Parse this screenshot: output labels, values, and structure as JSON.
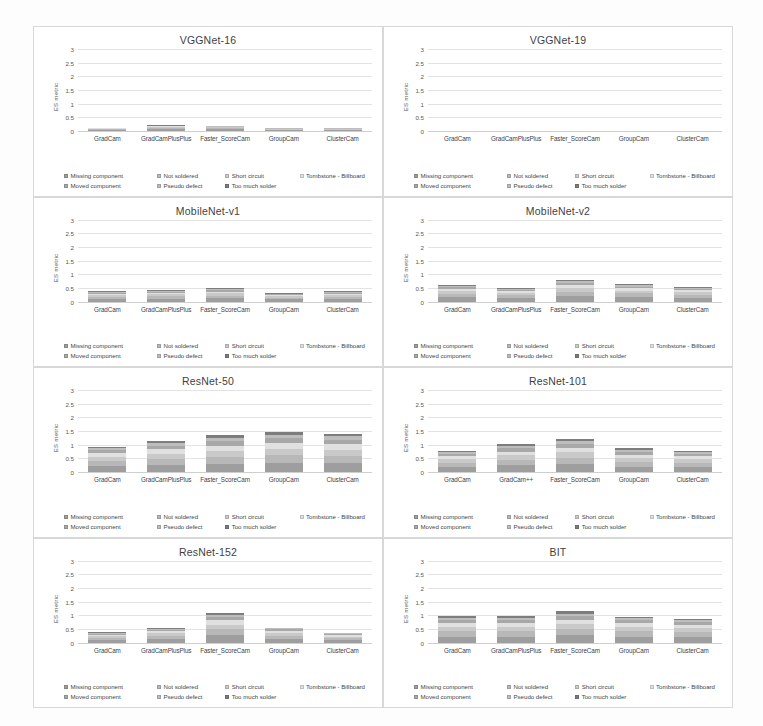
{
  "figure": {
    "ylabel": "ES metric",
    "yticks": [
      "0",
      "0.5",
      "1",
      "1.5",
      "2",
      "2.5",
      "3"
    ],
    "ylim": [
      0,
      3
    ]
  },
  "legend": [
    {
      "label": "Missing component",
      "color": "#9e9e9e"
    },
    {
      "label": "Not soldered",
      "color": "#b8b8b8"
    },
    {
      "label": "Short circuit",
      "color": "#c9c9c9"
    },
    {
      "label": "Tombstone - Billboard",
      "color": "#e0e0e0"
    },
    {
      "label": "Moved component",
      "color": "#a8a8a8"
    },
    {
      "label": "Pseudo defect",
      "color": "#bdbdbd"
    },
    {
      "label": "Too much solder",
      "color": "#7d7d7d"
    }
  ],
  "chart_data": [
    {
      "type": "bar",
      "title": "VGGNet-16",
      "xlabel": "",
      "ylabel": "ES metric",
      "ylim": [
        0,
        3
      ],
      "grid": true,
      "legend_position": "bottom",
      "categories": [
        "GradCam",
        "GradCamPlusPlus",
        "Faster_ScoreCam",
        "GroupCam",
        "ClusterCam"
      ],
      "series": [
        {
          "name": "Missing component",
          "values": [
            0.04,
            0.07,
            0.06,
            0.03,
            0.03
          ]
        },
        {
          "name": "Not soldered",
          "values": [
            0.03,
            0.05,
            0.04,
            0.02,
            0.02
          ]
        },
        {
          "name": "Short circuit",
          "values": [
            0.02,
            0.03,
            0.03,
            0.02,
            0.02
          ]
        },
        {
          "name": "Tombstone - Billboard",
          "values": [
            0.01,
            0.02,
            0.02,
            0.01,
            0.01
          ]
        },
        {
          "name": "Moved component",
          "values": [
            0.01,
            0.02,
            0.01,
            0.01,
            0.01
          ]
        },
        {
          "name": "Pseudo defect",
          "values": [
            0.01,
            0.01,
            0.01,
            0.01,
            0.01
          ]
        },
        {
          "name": "Too much solder",
          "values": [
            0.01,
            0.01,
            0.01,
            0.01,
            0.01
          ]
        }
      ],
      "totals": [
        0.13,
        0.21,
        0.18,
        0.11,
        0.11
      ]
    },
    {
      "type": "bar",
      "title": "VGGNet-19",
      "xlabel": "",
      "ylabel": "ES metric",
      "ylim": [
        0,
        3
      ],
      "grid": true,
      "legend_position": "bottom",
      "categories": [
        "GradCam",
        "GradCamPlusPlus",
        "Faster_ScoreCam",
        "GroupCam",
        "ClusterCam"
      ],
      "series": [
        {
          "name": "Missing component",
          "values": [
            0,
            0,
            0,
            0,
            0
          ]
        },
        {
          "name": "Not soldered",
          "values": [
            0,
            0,
            0,
            0,
            0
          ]
        },
        {
          "name": "Short circuit",
          "values": [
            0,
            0,
            0,
            0,
            0
          ]
        },
        {
          "name": "Tombstone - Billboard",
          "values": [
            0,
            0,
            0,
            0,
            0
          ]
        },
        {
          "name": "Moved component",
          "values": [
            0,
            0,
            0,
            0,
            0
          ]
        },
        {
          "name": "Pseudo defect",
          "values": [
            0,
            0,
            0,
            0,
            0
          ]
        },
        {
          "name": "Too much solder",
          "values": [
            0,
            0,
            0,
            0,
            0
          ]
        }
      ],
      "totals": [
        0,
        0,
        0,
        0,
        0
      ]
    },
    {
      "type": "bar",
      "title": "MobileNet-v1",
      "xlabel": "",
      "ylabel": "ES metric",
      "ylim": [
        0,
        3
      ],
      "grid": true,
      "legend_position": "bottom",
      "categories": [
        "GradCam",
        "GradCamPlusPlus",
        "Faster_ScoreCam",
        "GroupCam",
        "ClusterCam"
      ],
      "series": [
        {
          "name": "Missing component",
          "values": [
            0.1,
            0.11,
            0.12,
            0.08,
            0.1
          ]
        },
        {
          "name": "Not soldered",
          "values": [
            0.08,
            0.09,
            0.1,
            0.06,
            0.08
          ]
        },
        {
          "name": "Short circuit",
          "values": [
            0.06,
            0.07,
            0.08,
            0.05,
            0.06
          ]
        },
        {
          "name": "Tombstone - Billboard",
          "values": [
            0.05,
            0.05,
            0.06,
            0.04,
            0.05
          ]
        },
        {
          "name": "Moved component",
          "values": [
            0.04,
            0.04,
            0.05,
            0.03,
            0.04
          ]
        },
        {
          "name": "Pseudo defect",
          "values": [
            0.03,
            0.03,
            0.04,
            0.02,
            0.03
          ]
        },
        {
          "name": "Too much solder",
          "values": [
            0.02,
            0.03,
            0.03,
            0.02,
            0.02
          ]
        }
      ],
      "totals": [
        0.38,
        0.42,
        0.48,
        0.3,
        0.38
      ]
    },
    {
      "type": "bar",
      "title": "MobileNet-v2",
      "xlabel": "",
      "ylabel": "ES metric",
      "ylim": [
        0,
        3
      ],
      "grid": true,
      "legend_position": "bottom",
      "categories": [
        "GradCam",
        "GradCamPlusPlus",
        "Faster_ScoreCam",
        "GroupCam",
        "ClusterCam"
      ],
      "series": [
        {
          "name": "Missing component",
          "values": [
            0.16,
            0.13,
            0.2,
            0.17,
            0.14
          ]
        },
        {
          "name": "Not soldered",
          "values": [
            0.12,
            0.1,
            0.16,
            0.13,
            0.11
          ]
        },
        {
          "name": "Short circuit",
          "values": [
            0.1,
            0.08,
            0.13,
            0.1,
            0.09
          ]
        },
        {
          "name": "Tombstone - Billboard",
          "values": [
            0.08,
            0.06,
            0.1,
            0.08,
            0.07
          ]
        },
        {
          "name": "Moved component",
          "values": [
            0.06,
            0.05,
            0.08,
            0.06,
            0.05
          ]
        },
        {
          "name": "Pseudo defect",
          "values": [
            0.05,
            0.04,
            0.07,
            0.05,
            0.04
          ]
        },
        {
          "name": "Too much solder",
          "values": [
            0.03,
            0.04,
            0.06,
            0.06,
            0.05
          ]
        }
      ],
      "totals": [
        0.6,
        0.5,
        0.8,
        0.65,
        0.55
      ]
    },
    {
      "type": "bar",
      "title": "ResNet-50",
      "xlabel": "",
      "ylabel": "ES metric",
      "ylim": [
        0,
        3
      ],
      "grid": true,
      "legend_position": "bottom",
      "categories": [
        "GradCam",
        "GradCamPlusPlus",
        "Faster_ScoreCam",
        "GroupCam",
        "ClusterCam"
      ],
      "series": [
        {
          "name": "Missing component",
          "values": [
            0.22,
            0.26,
            0.3,
            0.33,
            0.32
          ]
        },
        {
          "name": "Not soldered",
          "values": [
            0.18,
            0.22,
            0.26,
            0.28,
            0.27
          ]
        },
        {
          "name": "Short circuit",
          "values": [
            0.15,
            0.19,
            0.22,
            0.24,
            0.23
          ]
        },
        {
          "name": "Tombstone - Billboard",
          "values": [
            0.13,
            0.16,
            0.19,
            0.21,
            0.2
          ]
        },
        {
          "name": "Moved component",
          "values": [
            0.11,
            0.14,
            0.16,
            0.17,
            0.17
          ]
        },
        {
          "name": "Pseudo defect",
          "values": [
            0.08,
            0.1,
            0.12,
            0.13,
            0.12
          ]
        },
        {
          "name": "Too much solder",
          "values": [
            0.06,
            0.08,
            0.1,
            0.09,
            0.09
          ]
        }
      ],
      "totals": [
        0.93,
        1.15,
        1.35,
        1.45,
        1.4
      ]
    },
    {
      "type": "bar",
      "title": "ResNet-101",
      "xlabel": "",
      "ylabel": "ES metric",
      "ylim": [
        0,
        3
      ],
      "grid": true,
      "legend_position": "bottom",
      "categories": [
        "GradCam",
        "GradCam++",
        "Faster_ScoreCam",
        "GroupCam",
        "ClusterCam"
      ],
      "series": [
        {
          "name": "Missing component",
          "values": [
            0.18,
            0.24,
            0.28,
            0.2,
            0.18
          ]
        },
        {
          "name": "Not soldered",
          "values": [
            0.15,
            0.2,
            0.24,
            0.17,
            0.15
          ]
        },
        {
          "name": "Short circuit",
          "values": [
            0.13,
            0.17,
            0.2,
            0.14,
            0.13
          ]
        },
        {
          "name": "Tombstone - Billboard",
          "values": [
            0.11,
            0.14,
            0.17,
            0.12,
            0.11
          ]
        },
        {
          "name": "Moved component",
          "values": [
            0.09,
            0.12,
            0.14,
            0.1,
            0.09
          ]
        },
        {
          "name": "Pseudo defect",
          "values": [
            0.07,
            0.09,
            0.11,
            0.08,
            0.07
          ]
        },
        {
          "name": "Too much solder",
          "values": [
            0.05,
            0.07,
            0.08,
            0.06,
            0.05
          ]
        }
      ],
      "totals": [
        0.78,
        1.03,
        1.22,
        0.87,
        0.78
      ]
    },
    {
      "type": "bar",
      "title": "ResNet-152",
      "xlabel": "",
      "ylabel": "ES metric",
      "ylim": [
        0,
        3
      ],
      "grid": true,
      "legend_position": "bottom",
      "categories": [
        "GradCam",
        "GradCamPlusPlus",
        "Faster_ScoreCam",
        "GroupCam",
        "ClusterCam"
      ],
      "series": [
        {
          "name": "Missing component",
          "values": [
            0.1,
            0.14,
            0.26,
            0.14,
            0.09
          ]
        },
        {
          "name": "Not soldered",
          "values": [
            0.08,
            0.11,
            0.22,
            0.11,
            0.07
          ]
        },
        {
          "name": "Short circuit",
          "values": [
            0.06,
            0.09,
            0.18,
            0.09,
            0.06
          ]
        },
        {
          "name": "Tombstone - Billboard",
          "values": [
            0.05,
            0.07,
            0.15,
            0.08,
            0.05
          ]
        },
        {
          "name": "Moved component",
          "values": [
            0.04,
            0.06,
            0.12,
            0.06,
            0.04
          ]
        },
        {
          "name": "Pseudo defect",
          "values": [
            0.03,
            0.04,
            0.09,
            0.04,
            0.03
          ]
        },
        {
          "name": "Too much solder",
          "values": [
            0.03,
            0.04,
            0.08,
            0.03,
            0.02
          ]
        }
      ],
      "totals": [
        0.39,
        0.55,
        1.1,
        0.55,
        0.36
      ]
    },
    {
      "type": "bar",
      "title": "BIT",
      "xlabel": "",
      "ylabel": "ES metric",
      "ylim": [
        0,
        3
      ],
      "grid": true,
      "legend_position": "bottom",
      "categories": [
        "GradCam",
        "GradCamPlusPlus",
        "Faster_ScoreCam",
        "GroupCam",
        "ClusterCam"
      ],
      "series": [
        {
          "name": "Missing component",
          "values": [
            0.22,
            0.22,
            0.26,
            0.22,
            0.2
          ]
        },
        {
          "name": "Not soldered",
          "values": [
            0.19,
            0.19,
            0.22,
            0.19,
            0.17
          ]
        },
        {
          "name": "Short circuit",
          "values": [
            0.16,
            0.16,
            0.19,
            0.16,
            0.15
          ]
        },
        {
          "name": "Tombstone - Billboard",
          "values": [
            0.14,
            0.14,
            0.16,
            0.13,
            0.13
          ]
        },
        {
          "name": "Moved component",
          "values": [
            0.11,
            0.11,
            0.13,
            0.11,
            0.1
          ]
        },
        {
          "name": "Pseudo defect",
          "values": [
            0.09,
            0.09,
            0.1,
            0.08,
            0.08
          ]
        },
        {
          "name": "Too much solder",
          "values": [
            0.06,
            0.06,
            0.09,
            0.06,
            0.05
          ]
        }
      ],
      "totals": [
        0.97,
        0.97,
        1.15,
        0.95,
        0.88
      ]
    }
  ]
}
